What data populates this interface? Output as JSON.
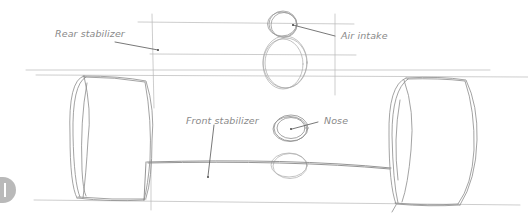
{
  "diagram": {
    "labels": {
      "rear_stabilizer": "Rear stabilizer",
      "air_intake": "Air intake",
      "front_stabilizer": "Front stabilizer",
      "nose": "Nose"
    },
    "step_badge": {
      "icon": "step-number-1-icon"
    },
    "colors": {
      "pencil": "#8c8c8c",
      "pencil_light": "#b5b5b5",
      "label_text": "#8a8a8a",
      "badge": "#b9b9b9"
    }
  }
}
